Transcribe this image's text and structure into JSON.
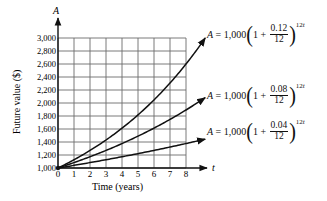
{
  "chart_data": {
    "type": "line",
    "title": "",
    "xlabel": "Time (years)",
    "ylabel": "Future value ($)",
    "x_axis_symbol": "t",
    "y_axis_symbol": "A",
    "xlim": [
      0,
      8
    ],
    "ylim": [
      1000,
      3000
    ],
    "x_ticks": [
      "0",
      "1",
      "2",
      "3",
      "4",
      "5",
      "6",
      "7",
      "8"
    ],
    "y_ticks": [
      "1,000",
      "1,200",
      "1,400",
      "1,600",
      "1,800",
      "2,000",
      "2,200",
      "2,400",
      "2,600",
      "2,800",
      "3,000"
    ],
    "grid": true,
    "legend_position": "right (inline labels at curve ends)",
    "x": [
      0,
      1,
      2,
      3,
      4,
      5,
      6,
      7,
      8
    ],
    "series": [
      {
        "name": "A = 1,000(1 + 0.12/12)^(12t)",
        "rate": "0.12",
        "values": [
          1000,
          1127,
          1270,
          1431,
          1612,
          1817,
          2047,
          2307,
          2601
        ]
      },
      {
        "name": "A = 1,000(1 + 0.08/12)^(12t)",
        "rate": "0.08",
        "values": [
          1000,
          1083,
          1173,
          1270,
          1376,
          1490,
          1614,
          1748,
          1894
        ]
      },
      {
        "name": "A = 1,000(1 + 0.04/12)^(12t)",
        "rate": "0.04",
        "values": [
          1000,
          1041,
          1083,
          1127,
          1173,
          1221,
          1271,
          1323,
          1376
        ]
      }
    ],
    "annotations": [
      {
        "text": "A = 1,000(1 + 0.12/12)^12t"
      },
      {
        "text": "A = 1,000(1 + 0.08/12)^12t"
      },
      {
        "text": "A = 1,000(1 + 0.04/12)^12t"
      }
    ]
  },
  "labels": {
    "y_axis_symbol": "A",
    "x_axis_symbol": "t",
    "xlabel": "Time (years)",
    "ylabel": "Future value ($)"
  },
  "formulas": [
    {
      "lhs": "A",
      "eq": "= 1,000",
      "one_plus": "1 +",
      "num": "0.12",
      "den": "12",
      "exp_coef": "12",
      "exp_var": "t"
    },
    {
      "lhs": "A",
      "eq": "= 1,000",
      "one_plus": "1 +",
      "num": "0.08",
      "den": "12",
      "exp_coef": "12",
      "exp_var": "t"
    },
    {
      "lhs": "A",
      "eq": "= 1,000",
      "one_plus": "1 +",
      "num": "0.04",
      "den": "12",
      "exp_coef": "12",
      "exp_var": "t"
    }
  ]
}
